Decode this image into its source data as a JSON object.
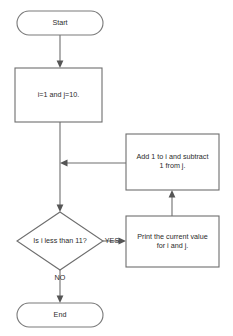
{
  "diagram": {
    "background_color": "#ffffff",
    "line_color": "#6e6e6e",
    "text_color": "#2b2b2b",
    "nodes": {
      "start": {
        "label": "Start",
        "shape": "terminator"
      },
      "init": {
        "label": "i=1 and j=10.",
        "shape": "process"
      },
      "increment": {
        "label": "Add 1 to i and subtract\n1 from j.",
        "shape": "process"
      },
      "decision": {
        "label": "Is i less than 11?",
        "shape": "decision"
      },
      "print": {
        "label": "Print the current value\nfor i and j.",
        "shape": "process"
      },
      "end": {
        "label": "End",
        "shape": "terminator"
      }
    },
    "edges": {
      "yes_label": "YES",
      "no_label": "NO"
    }
  }
}
